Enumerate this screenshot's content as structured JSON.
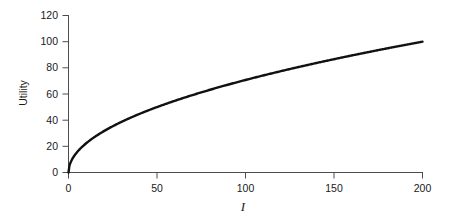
{
  "chart_data": {
    "type": "line",
    "title": "",
    "subtitle": "",
    "xlabel": "I",
    "ylabel": "Utility",
    "xlim": [
      0,
      200
    ],
    "ylim": [
      0,
      120
    ],
    "xticks": [
      0,
      50,
      100,
      150,
      200
    ],
    "yticks": [
      0,
      20,
      40,
      60,
      80,
      100,
      120
    ],
    "xtick_labels": [
      "0",
      "50",
      "100",
      "150",
      "200"
    ],
    "ytick_labels": [
      "0",
      "20",
      "40",
      "60",
      "80",
      "100",
      "120"
    ],
    "grid": false,
    "legend": null,
    "series": [
      {
        "name": "Utility",
        "color": "#111111",
        "line_width": 2.4,
        "function": "U = 100 * sqrt(I / 200)",
        "x": [
          0,
          2,
          5,
          10,
          15,
          20,
          25,
          30,
          40,
          50,
          60,
          70,
          80,
          90,
          100,
          110,
          120,
          130,
          140,
          150,
          160,
          170,
          180,
          190,
          200
        ],
        "values": [
          0,
          10,
          15.8,
          22.4,
          27.4,
          31.6,
          35.4,
          38.7,
          44.7,
          50,
          54.8,
          59.2,
          63.2,
          67.1,
          70.7,
          74.2,
          77.5,
          80.6,
          83.7,
          86.6,
          89.4,
          92.2,
          94.9,
          97.5,
          100
        ]
      }
    ],
    "annotations": []
  },
  "axes": {
    "x_axis_name": "income-axis",
    "y_axis_name": "utility-axis"
  }
}
